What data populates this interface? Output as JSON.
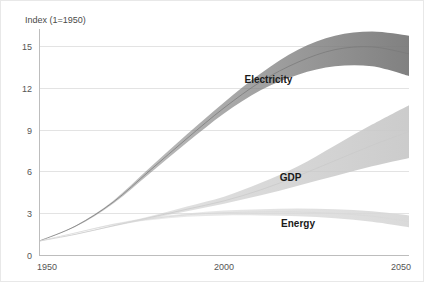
{
  "chart_data": {
    "type": "area",
    "title": "",
    "subtitle": "",
    "ylabel": "Index (1=1950)",
    "xlabel": "",
    "grid": true,
    "legend_position": "inline-annotations",
    "x": [
      1950,
      1960,
      1970,
      1980,
      1990,
      2000,
      2010,
      2020,
      2030,
      2040,
      2050
    ],
    "xlim": [
      1950,
      2050
    ],
    "ylim": [
      0,
      16
    ],
    "xticks": [
      1950,
      2000,
      2050
    ],
    "xtick_labels": [
      "1950",
      "2000",
      "2050"
    ],
    "yticks": [
      0,
      3,
      6,
      9,
      12,
      15
    ],
    "ytick_labels": [
      "0",
      "3",
      "6",
      "9",
      "12",
      "15"
    ],
    "series": [
      {
        "name": "Electricity",
        "color": "#7a7a7a",
        "label_x": 2012,
        "label_y": 12.4,
        "values": [
          1.0,
          2.1,
          3.8,
          6.1,
          8.4,
          10.6,
          12.5,
          13.9,
          14.8,
          15.0,
          14.5
        ],
        "band_low": [
          1.0,
          2.05,
          3.7,
          5.9,
          8.1,
          10.2,
          11.9,
          13.0,
          13.6,
          13.6,
          12.9
        ],
        "band_high": [
          1.0,
          2.15,
          3.9,
          6.3,
          8.7,
          11.0,
          13.1,
          14.8,
          15.8,
          16.1,
          15.8
        ]
      },
      {
        "name": "GDP",
        "color": "#c9c9c9",
        "label_x": 2018,
        "label_y": 5.3,
        "values": [
          1.0,
          1.5,
          2.1,
          2.7,
          3.3,
          3.9,
          4.7,
          5.7,
          6.8,
          7.9,
          8.9
        ],
        "band_low": [
          1.0,
          1.48,
          2.05,
          2.6,
          3.15,
          3.7,
          4.3,
          5.0,
          5.7,
          6.4,
          7.0
        ],
        "band_high": [
          1.0,
          1.52,
          2.15,
          2.8,
          3.5,
          4.2,
          5.2,
          6.4,
          7.9,
          9.4,
          10.8
        ]
      },
      {
        "name": "Energy",
        "color": "#d8d8d8",
        "label_x": 2020,
        "label_y": 2.0,
        "values": [
          1.0,
          1.6,
          2.2,
          2.6,
          2.9,
          3.05,
          3.1,
          3.1,
          3.0,
          2.8,
          2.4
        ],
        "band_low": [
          1.0,
          1.58,
          2.15,
          2.5,
          2.75,
          2.85,
          2.85,
          2.8,
          2.65,
          2.4,
          2.0
        ],
        "band_high": [
          1.0,
          1.62,
          2.25,
          2.7,
          3.0,
          3.2,
          3.3,
          3.35,
          3.3,
          3.15,
          2.85
        ]
      }
    ]
  },
  "figure": {
    "background_color": "#ffffff",
    "border_color": "#e8e8e8",
    "gridline_color": "#e3e3e3",
    "axis_color": "#bdbdbd"
  }
}
